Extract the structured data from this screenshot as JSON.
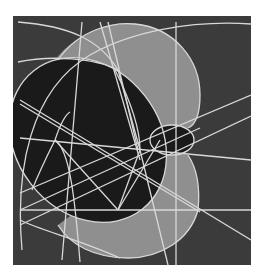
{
  "figure": {
    "title": "",
    "colors": {
      "page": "#ffffff",
      "background": "#3b3b3b",
      "large_disk": "#8f8f8f",
      "black_region": "#1a1a1a",
      "line": "#d8d8d8"
    },
    "frame": {
      "x": 13,
      "y": 16,
      "w": 238,
      "h": 249
    }
  }
}
